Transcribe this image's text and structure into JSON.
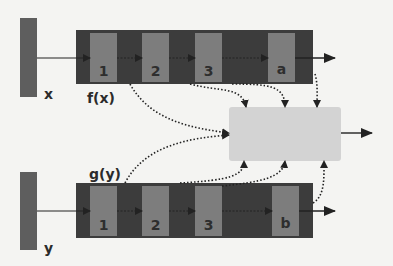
{
  "diagram": {
    "inputs": [
      {
        "id": "x",
        "label": "x"
      },
      {
        "id": "y",
        "label": "y"
      }
    ],
    "encoders": [
      {
        "id": "f",
        "label": "f(x)",
        "cells": [
          "1",
          "2",
          "3",
          "a"
        ]
      },
      {
        "id": "g",
        "label": "g(y)",
        "cells": [
          "1",
          "2",
          "3",
          "b"
        ]
      }
    ],
    "combiner": {
      "label": ""
    },
    "colors": {
      "input_bar": "#5e5e5e",
      "encoder_bg": "#3c3c3c",
      "cell": "#7d7d7d",
      "combiner": "#d3d3d3",
      "arrow": "#222222",
      "background": "#f4f4f2"
    }
  }
}
